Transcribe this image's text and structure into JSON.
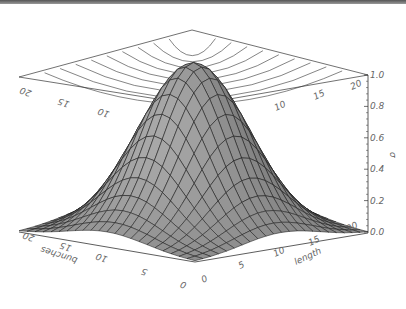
{
  "chart_data": {
    "type": "surface",
    "title": "",
    "function": "2D Gaussian peaked at grid center",
    "x_axis": {
      "label": "length",
      "ticks": [
        "0",
        "5",
        "10",
        "15",
        "20"
      ],
      "range": [
        0,
        22
      ]
    },
    "y_axis": {
      "label": "bunches",
      "ticks": [
        "0",
        "5",
        "10",
        "15",
        "20"
      ],
      "range": [
        0,
        22
      ]
    },
    "z_axis": {
      "label": "σ",
      "ticks": [
        "0.0",
        "0.2",
        "0.4",
        "0.6",
        "0.8",
        "1.0"
      ],
      "range": [
        0.0,
        1.0
      ]
    },
    "grid_size": [
      23,
      23
    ],
    "peak": {
      "x": 11,
      "y": 11,
      "z": 1.0
    },
    "sigma_grid_units": 5,
    "top_plane_contours": true,
    "back_plane_ticks": {
      "left": [
        "20",
        "15",
        "10"
      ],
      "right": [
        "10",
        "15",
        "20"
      ]
    },
    "surface_color": "#8a8a8a",
    "mesh_color": "#222222"
  }
}
